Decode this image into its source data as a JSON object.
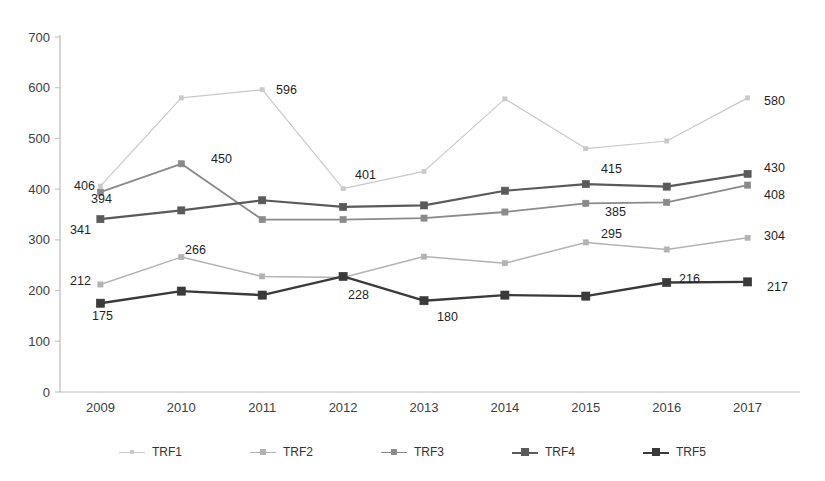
{
  "chart_data": {
    "type": "line",
    "title": "",
    "xlabel": "",
    "ylabel": "",
    "categories": [
      "2009",
      "2010",
      "2011",
      "2012",
      "2013",
      "2014",
      "2015",
      "2016",
      "2017"
    ],
    "ylim": [
      0,
      700
    ],
    "yticks": [
      0,
      100,
      200,
      300,
      400,
      500,
      600,
      700
    ],
    "ytick_labels": [
      "0",
      "100",
      "200",
      "300",
      "400",
      "500",
      "600",
      "700"
    ],
    "grid": false,
    "legend_position": "bottom",
    "series": [
      {
        "name": "TRF1",
        "color": "#c9c9c9",
        "values": [
          406,
          580,
          596,
          401,
          435,
          578,
          480,
          495,
          580
        ],
        "labels": [
          {
            "index": 0,
            "text": "406"
          },
          {
            "index": 2,
            "text": "596"
          },
          {
            "index": 3,
            "text": "401"
          },
          {
            "index": 8,
            "text": "580"
          }
        ]
      },
      {
        "name": "TRF2",
        "color": "#b3b3b3",
        "values": [
          212,
          266,
          228,
          226,
          267,
          254,
          295,
          281,
          304
        ],
        "labels": [
          {
            "index": 0,
            "text": "212"
          },
          {
            "index": 1,
            "text": "266"
          },
          {
            "index": 6,
            "text": "295"
          },
          {
            "index": 8,
            "text": "304"
          }
        ]
      },
      {
        "name": "TRF3",
        "color": "#8a8a8a",
        "values": [
          394,
          450,
          340,
          340,
          343,
          355,
          372,
          374,
          408
        ],
        "labels": [
          {
            "index": 0,
            "text": "394"
          },
          {
            "index": 6,
            "text": "385"
          },
          {
            "index": 8,
            "text": "408"
          }
        ]
      },
      {
        "name": "TRF4",
        "color": "#5a5a5a",
        "values": [
          341,
          358,
          378,
          365,
          368,
          397,
          410,
          405,
          430
        ],
        "labels": [
          {
            "index": 0,
            "text": "341"
          },
          {
            "index": 6,
            "text": "415"
          },
          {
            "index": 8,
            "text": "430"
          }
        ]
      },
      {
        "name": "TRF5",
        "color": "#3a3a3a",
        "values": [
          175,
          199,
          191,
          228,
          180,
          191,
          189,
          216,
          217
        ],
        "labels": [
          {
            "index": 0,
            "text": "175"
          },
          {
            "index": 1,
            "text": "450"
          },
          {
            "index": 3,
            "text": "228"
          },
          {
            "index": 4,
            "text": "180"
          },
          {
            "index": 7,
            "text": "216"
          },
          {
            "index": 8,
            "text": "217"
          }
        ]
      }
    ]
  },
  "legend": {
    "items": [
      {
        "label": "TRF1"
      },
      {
        "label": "TRF2"
      },
      {
        "label": "TRF3"
      },
      {
        "label": "TRF4"
      },
      {
        "label": "TRF5"
      }
    ]
  },
  "annotations": [
    {
      "name": "label-trf1-2009",
      "text": "406",
      "x": 74,
      "y": 179
    },
    {
      "name": "label-trf3-2009",
      "text": "394",
      "x": 91,
      "y": 192
    },
    {
      "name": "label-trf4-2009",
      "text": "341",
      "x": 70,
      "y": 223
    },
    {
      "name": "label-trf2-2009",
      "text": "212",
      "x": 70,
      "y": 274
    },
    {
      "name": "label-trf5-2009",
      "text": "175",
      "x": 92,
      "y": 309
    },
    {
      "name": "label-trf3-2010",
      "text": "450",
      "x": 211,
      "y": 152
    },
    {
      "name": "label-trf2-2010",
      "text": "266",
      "x": 185,
      "y": 243
    },
    {
      "name": "label-trf1-2011",
      "text": "596",
      "x": 276,
      "y": 83
    },
    {
      "name": "label-trf1-2012",
      "text": "401",
      "x": 355,
      "y": 168
    },
    {
      "name": "label-trf5-2012",
      "text": "228",
      "x": 348,
      "y": 288
    },
    {
      "name": "label-trf5-2013",
      "text": "180",
      "x": 437,
      "y": 310
    },
    {
      "name": "label-trf4-2015",
      "text": "415",
      "x": 601,
      "y": 162
    },
    {
      "name": "label-trf3-2015",
      "text": "385",
      "x": 605,
      "y": 205
    },
    {
      "name": "label-trf2-2015",
      "text": "295",
      "x": 601,
      "y": 227
    },
    {
      "name": "label-trf5-2016",
      "text": "216",
      "x": 679,
      "y": 272
    },
    {
      "name": "label-trf1-2017",
      "text": "580",
      "x": 764,
      "y": 94
    },
    {
      "name": "label-trf4-2017",
      "text": "430",
      "x": 764,
      "y": 161
    },
    {
      "name": "label-trf3-2017",
      "text": "408",
      "x": 764,
      "y": 188
    },
    {
      "name": "label-trf2-2017",
      "text": "304",
      "x": 764,
      "y": 229
    },
    {
      "name": "label-trf5-2017",
      "text": "217",
      "x": 767,
      "y": 280
    }
  ]
}
